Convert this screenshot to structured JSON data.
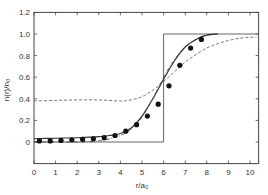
{
  "chart_data": {
    "type": "line",
    "title": "",
    "xlabel": "r/a₀",
    "ylabel": "n(r)/n₀",
    "xlim": [
      0,
      10.4
    ],
    "ylim": [
      -0.2,
      1.2
    ],
    "grid": false,
    "legend": null,
    "xticks": [
      0,
      1,
      2,
      3,
      4,
      5,
      6,
      7,
      8,
      9,
      10
    ],
    "yticks": [
      0,
      0.2,
      0.4,
      0.6,
      0.8,
      1.0,
      1.2
    ],
    "ytick_labels": [
      "0",
      "0.2",
      "0.4",
      "0.6",
      "0.8",
      "1.0",
      "1.2"
    ],
    "series": [
      {
        "name": "step profile",
        "style": "solid-thin",
        "x": [
          0,
          6,
          6,
          10.4
        ],
        "y": [
          0,
          0,
          1,
          1
        ]
      },
      {
        "name": "solid curve",
        "style": "solid",
        "x": [
          0,
          1,
          2,
          3,
          3.5,
          4,
          4.5,
          5,
          5.5,
          6,
          6.5,
          7,
          7.5,
          8,
          8.5
        ],
        "y": [
          0.03,
          0.035,
          0.04,
          0.05,
          0.06,
          0.08,
          0.13,
          0.24,
          0.4,
          0.58,
          0.75,
          0.88,
          0.95,
          0.99,
          1.0
        ]
      },
      {
        "name": "dash-dot curve",
        "style": "dashdot",
        "x": [
          0,
          1,
          2,
          3,
          3.5,
          4,
          4.5,
          5,
          5.5,
          6,
          6.5,
          7,
          7.5,
          8,
          8.5
        ],
        "y": [
          0.0,
          0.0,
          0.0,
          0.01,
          0.03,
          0.06,
          0.12,
          0.23,
          0.4,
          0.6,
          0.76,
          0.88,
          0.95,
          0.99,
          1.0
        ]
      },
      {
        "name": "dashed curve",
        "style": "dashed",
        "x": [
          0,
          1,
          2,
          3,
          4,
          4.5,
          5,
          5.5,
          6,
          6.5,
          7,
          7.5,
          8,
          8.5,
          9,
          9.5,
          10,
          10.3
        ],
        "y": [
          0.38,
          0.385,
          0.39,
          0.39,
          0.38,
          0.39,
          0.42,
          0.48,
          0.56,
          0.65,
          0.74,
          0.81,
          0.87,
          0.91,
          0.94,
          0.96,
          0.97,
          0.97
        ]
      },
      {
        "name": "data points",
        "style": "markers",
        "x": [
          0.25,
          0.75,
          1.25,
          1.75,
          2.25,
          2.75,
          3.25,
          3.75,
          4.25,
          4.75,
          5.25,
          5.75,
          6.25,
          6.75,
          7.25,
          7.75
        ],
        "y": [
          0.01,
          0.01,
          0.015,
          0.02,
          0.025,
          0.03,
          0.04,
          0.06,
          0.1,
          0.16,
          0.24,
          0.35,
          0.52,
          0.71,
          0.87,
          0.95
        ]
      }
    ]
  }
}
